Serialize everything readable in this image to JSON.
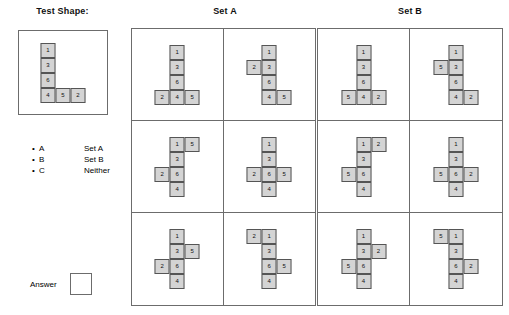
{
  "headings": {
    "test_shape": "Test Shape:",
    "set_a": "Set A",
    "set_b": "Set B"
  },
  "legend": {
    "bullet": "•",
    "items": [
      {
        "key": "A",
        "value": "Set A"
      },
      {
        "key": "B",
        "value": "Set B"
      },
      {
        "key": "C",
        "value": "Neither"
      }
    ]
  },
  "answer": {
    "label": "Answer",
    "value": ""
  },
  "cell_style": {
    "fill": "#d4d4d4",
    "stroke": "#555555"
  },
  "test_shape": {
    "cells": [
      {
        "col": 0,
        "row": 0,
        "label": "1"
      },
      {
        "col": 0,
        "row": 1,
        "label": "3"
      },
      {
        "col": 0,
        "row": 2,
        "label": "6"
      },
      {
        "col": 0,
        "row": 3,
        "label": "4"
      },
      {
        "col": 1,
        "row": 3,
        "label": "5"
      },
      {
        "col": 2,
        "row": 3,
        "label": "2"
      }
    ]
  },
  "set_a": {
    "shapes": [
      {
        "id": "a1",
        "cells": [
          {
            "col": 1,
            "row": 0,
            "label": "1"
          },
          {
            "col": 1,
            "row": 1,
            "label": "3"
          },
          {
            "col": 1,
            "row": 2,
            "label": "6"
          },
          {
            "col": 0,
            "row": 3,
            "label": "2"
          },
          {
            "col": 1,
            "row": 3,
            "label": "4"
          },
          {
            "col": 2,
            "row": 3,
            "label": "5"
          }
        ]
      },
      {
        "id": "a2",
        "cells": [
          {
            "col": 1,
            "row": 0,
            "label": "1"
          },
          {
            "col": 0,
            "row": 1,
            "label": "2"
          },
          {
            "col": 1,
            "row": 1,
            "label": "3"
          },
          {
            "col": 1,
            "row": 2,
            "label": "6"
          },
          {
            "col": 1,
            "row": 3,
            "label": "4"
          },
          {
            "col": 2,
            "row": 3,
            "label": "5"
          }
        ]
      },
      {
        "id": "a3",
        "cells": [
          {
            "col": 1,
            "row": 0,
            "label": "1"
          },
          {
            "col": 2,
            "row": 0,
            "label": "5"
          },
          {
            "col": 1,
            "row": 1,
            "label": "3"
          },
          {
            "col": 0,
            "row": 2,
            "label": "2"
          },
          {
            "col": 1,
            "row": 2,
            "label": "6"
          },
          {
            "col": 1,
            "row": 3,
            "label": "4"
          }
        ]
      },
      {
        "id": "a4",
        "cells": [
          {
            "col": 1,
            "row": 0,
            "label": "1"
          },
          {
            "col": 1,
            "row": 1,
            "label": "3"
          },
          {
            "col": 0,
            "row": 2,
            "label": "2"
          },
          {
            "col": 1,
            "row": 2,
            "label": "6"
          },
          {
            "col": 2,
            "row": 2,
            "label": "5"
          },
          {
            "col": 1,
            "row": 3,
            "label": "4"
          }
        ]
      },
      {
        "id": "a5",
        "cells": [
          {
            "col": 1,
            "row": 0,
            "label": "1"
          },
          {
            "col": 1,
            "row": 1,
            "label": "3"
          },
          {
            "col": 2,
            "row": 1,
            "label": "5"
          },
          {
            "col": 0,
            "row": 2,
            "label": "2"
          },
          {
            "col": 1,
            "row": 2,
            "label": "6"
          },
          {
            "col": 1,
            "row": 3,
            "label": "4"
          }
        ]
      },
      {
        "id": "a6",
        "cells": [
          {
            "col": 0,
            "row": 0,
            "label": "2"
          },
          {
            "col": 1,
            "row": 0,
            "label": "1"
          },
          {
            "col": 1,
            "row": 1,
            "label": "3"
          },
          {
            "col": 1,
            "row": 2,
            "label": "6"
          },
          {
            "col": 2,
            "row": 2,
            "label": "5"
          },
          {
            "col": 1,
            "row": 3,
            "label": "4"
          }
        ]
      }
    ]
  },
  "set_b": {
    "shapes": [
      {
        "id": "b1",
        "cells": [
          {
            "col": 1,
            "row": 0,
            "label": "1"
          },
          {
            "col": 1,
            "row": 1,
            "label": "3"
          },
          {
            "col": 1,
            "row": 2,
            "label": "6"
          },
          {
            "col": 0,
            "row": 3,
            "label": "5"
          },
          {
            "col": 1,
            "row": 3,
            "label": "4"
          },
          {
            "col": 2,
            "row": 3,
            "label": "2"
          }
        ]
      },
      {
        "id": "b2",
        "cells": [
          {
            "col": 1,
            "row": 0,
            "label": "1"
          },
          {
            "col": 0,
            "row": 1,
            "label": "5"
          },
          {
            "col": 1,
            "row": 1,
            "label": "3"
          },
          {
            "col": 1,
            "row": 2,
            "label": "6"
          },
          {
            "col": 1,
            "row": 3,
            "label": "4"
          },
          {
            "col": 2,
            "row": 3,
            "label": "2"
          }
        ]
      },
      {
        "id": "b3",
        "cells": [
          {
            "col": 1,
            "row": 0,
            "label": "1"
          },
          {
            "col": 2,
            "row": 0,
            "label": "2"
          },
          {
            "col": 1,
            "row": 1,
            "label": "3"
          },
          {
            "col": 0,
            "row": 2,
            "label": "5"
          },
          {
            "col": 1,
            "row": 2,
            "label": "6"
          },
          {
            "col": 1,
            "row": 3,
            "label": "4"
          }
        ]
      },
      {
        "id": "b4",
        "cells": [
          {
            "col": 1,
            "row": 0,
            "label": "1"
          },
          {
            "col": 1,
            "row": 1,
            "label": "3"
          },
          {
            "col": 0,
            "row": 2,
            "label": "5"
          },
          {
            "col": 1,
            "row": 2,
            "label": "6"
          },
          {
            "col": 2,
            "row": 2,
            "label": "2"
          },
          {
            "col": 1,
            "row": 3,
            "label": "4"
          }
        ]
      },
      {
        "id": "b5",
        "cells": [
          {
            "col": 1,
            "row": 0,
            "label": "1"
          },
          {
            "col": 1,
            "row": 1,
            "label": "3"
          },
          {
            "col": 2,
            "row": 1,
            "label": "2"
          },
          {
            "col": 0,
            "row": 2,
            "label": "5"
          },
          {
            "col": 1,
            "row": 2,
            "label": "6"
          },
          {
            "col": 1,
            "row": 3,
            "label": "4"
          }
        ]
      },
      {
        "id": "b6",
        "cells": [
          {
            "col": 0,
            "row": 0,
            "label": "5"
          },
          {
            "col": 1,
            "row": 0,
            "label": "1"
          },
          {
            "col": 1,
            "row": 1,
            "label": "3"
          },
          {
            "col": 1,
            "row": 2,
            "label": "6"
          },
          {
            "col": 2,
            "row": 2,
            "label": "2"
          },
          {
            "col": 1,
            "row": 3,
            "label": "4"
          }
        ]
      }
    ]
  }
}
